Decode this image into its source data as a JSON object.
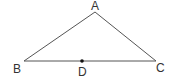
{
  "figure": {
    "type": "triangle",
    "vertices": {
      "A": {
        "label": "A",
        "x": 95,
        "y": 12
      },
      "B": {
        "label": "B",
        "x": 24,
        "y": 61
      },
      "C": {
        "label": "C",
        "x": 156,
        "y": 61
      }
    },
    "points": {
      "D": {
        "label": "D",
        "x": 82,
        "y": 61,
        "on_segment": "BC"
      }
    },
    "segments": [
      {
        "from": "A",
        "to": "B"
      },
      {
        "from": "A",
        "to": "C"
      },
      {
        "from": "B",
        "to": "C"
      }
    ],
    "colors": {
      "line": "#555555",
      "point": "#111111",
      "label": "#333333",
      "background": "#ffffff"
    }
  }
}
